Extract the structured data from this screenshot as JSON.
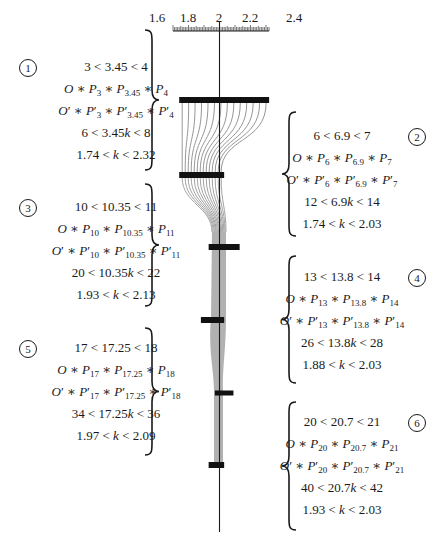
{
  "ruler": {
    "tick_labels": [
      "1.6",
      "1.8",
      "2",
      "2.2",
      "2.4"
    ],
    "range_start": 1.7,
    "range_end": 2.32,
    "center_value": "2"
  },
  "blocks": [
    {
      "badge": "1",
      "side": "left",
      "lines": {
        "range": "3 < 3.45 < 4",
        "points": "O * P3 * P3.45 * P4",
        "points_prime": "O' * P'3 * P'3.45 * P'4",
        "scaled": "6 < 3.45k < 8",
        "k_range": "1.74 < k < 2.32"
      },
      "lower": "3",
      "value": "3.45",
      "upper": "4",
      "scaled_lower": "6",
      "scaled_upper": "8",
      "k_min": "1.74",
      "k_max": "2.32"
    },
    {
      "badge": "2",
      "side": "right",
      "lower": "6",
      "value": "6.9",
      "upper": "7",
      "scaled_lower": "12",
      "scaled_upper": "14",
      "k_min": "1.74",
      "k_max": "2.03"
    },
    {
      "badge": "3",
      "side": "left",
      "lower": "10",
      "value": "10.35",
      "upper": "11",
      "scaled_lower": "20",
      "scaled_upper": "22",
      "k_min": "1.93",
      "k_max": "2.13"
    },
    {
      "badge": "4",
      "side": "right",
      "lower": "13",
      "value": "13.8",
      "upper": "14",
      "scaled_lower": "26",
      "scaled_upper": "28",
      "k_min": "1.88",
      "k_max": "2.03"
    },
    {
      "badge": "5",
      "side": "left",
      "lower": "17",
      "value": "17.25",
      "upper": "18",
      "scaled_lower": "34",
      "scaled_upper": "36",
      "k_min": "1.97",
      "k_max": "2.09"
    },
    {
      "badge": "6",
      "side": "right",
      "lower": "20",
      "value": "20.7",
      "upper": "21",
      "scaled_lower": "40",
      "scaled_upper": "42",
      "k_min": "1.93",
      "k_max": "2.03"
    }
  ],
  "bars": [
    {
      "label": "1",
      "k_min": 1.74,
      "k_max": 2.32
    },
    {
      "label": "2",
      "k_min": 1.74,
      "k_max": 2.03
    },
    {
      "label": "3",
      "k_min": 1.93,
      "k_max": 2.13
    },
    {
      "label": "4",
      "k_min": 1.88,
      "k_max": 2.03
    },
    {
      "label": "5",
      "k_min": 1.97,
      "k_max": 2.09
    },
    {
      "label": "6",
      "k_min": 1.93,
      "k_max": 2.03
    }
  ],
  "colors": {
    "ink": "#1a1a1a",
    "bar": "#111111",
    "funnel_line": "#8a8a8a",
    "funnel_fill": "#a9a9a9"
  }
}
